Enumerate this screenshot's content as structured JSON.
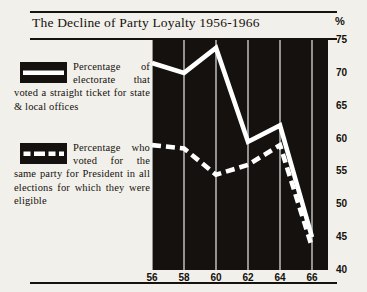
{
  "title": "The Decline of Party Loyalty 1956-1966",
  "percent_symbol": "%",
  "legend": [
    {
      "swatch": "solid-white-line",
      "text": "Percentage of electorate that voted a straight ticket for state & local offices"
    },
    {
      "swatch": "dashed-white-line",
      "text": "Percentage who voted for the same party for President in all elections for which they were eligible"
    }
  ],
  "chart_data": {
    "type": "line",
    "title": "The Decline of Party Loyalty 1956-1966",
    "xlabel": "",
    "ylabel": "%",
    "xlim": [
      56,
      67
    ],
    "ylim": [
      40,
      75
    ],
    "yticks": [
      40,
      45,
      50,
      55,
      60,
      65,
      70,
      75
    ],
    "xticks": [
      56,
      58,
      60,
      62,
      64,
      66
    ],
    "xtick_labels": [
      "56",
      "58",
      "60",
      "62",
      "64",
      "66"
    ],
    "ytick_labels": [
      "40",
      "45",
      "50",
      "55",
      "60",
      "65",
      "70",
      "75"
    ],
    "grid": "vertical-only",
    "legend_position": "left-outside",
    "plot_background": "#14110e",
    "line_color": "#ffffff",
    "series": [
      {
        "name": "Percentage of electorate that voted a straight ticket for state & local offices",
        "style": "solid",
        "x": [
          56,
          58,
          60,
          62,
          64,
          66
        ],
        "values": [
          71.5,
          70.0,
          73.8,
          59.5,
          62.0,
          45.0
        ]
      },
      {
        "name": "Percentage who voted for the same party for President in all elections for which they were eligible",
        "style": "dashed",
        "x": [
          56,
          58,
          60,
          62,
          64,
          66
        ],
        "values": [
          59.0,
          58.5,
          54.5,
          56.0,
          59.0,
          43.5
        ]
      }
    ]
  }
}
